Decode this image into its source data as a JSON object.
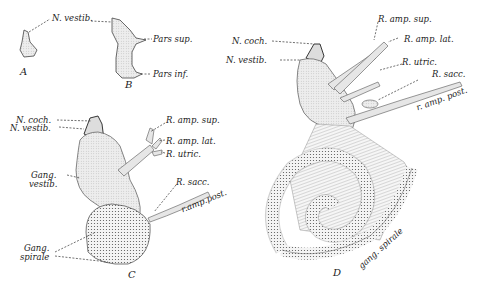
{
  "figure": {
    "panels": [
      {
        "id": "A",
        "caption": "A"
      },
      {
        "id": "B",
        "caption": "B"
      },
      {
        "id": "C",
        "caption": "C"
      },
      {
        "id": "D",
        "caption": "D"
      }
    ],
    "labels": {
      "ab_n_vestib": "N. vestib.",
      "b_pars_sup": "Pars sup.",
      "b_pars_inf": "Pars inf.",
      "c_n_coch": "N. coch.",
      "c_n_vestib": "N. vestib.",
      "c_gang_vestib_1": "Gang.",
      "c_gang_vestib_2": "vestib.",
      "c_gang_spirale_1": "Gang.",
      "c_gang_spirale_2": "spirale",
      "c_r_amp_sup": "R. amp. sup.",
      "c_r_amp_lat": "R. amp. lat.",
      "c_r_utric": "R. utric.",
      "c_r_sacc": "R. sacc.",
      "c_r_amp_post": "r.amp.post.",
      "d_n_coch": "N. coch.",
      "d_n_vestib": "N. vestib.",
      "d_r_amp_sup": "R. amp. sup.",
      "d_r_amp_lat": "R. amp. lat.",
      "d_r_utric": "R. utric.",
      "d_r_sacc": "R. sacc.",
      "d_r_amp_post": "r. amp. post.",
      "d_gang_spirale": "gang. spirale"
    }
  }
}
